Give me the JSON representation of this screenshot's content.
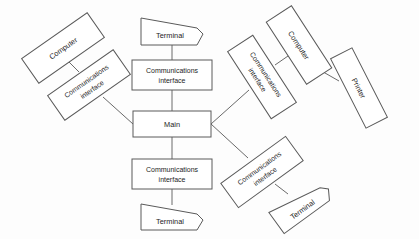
{
  "diagram": {
    "type": "node-link-diagram",
    "background_color": "#fdfdfd",
    "stroke_color": "#5a5a5a",
    "text_color": "#1d1d1d",
    "labels": {
      "main": "Main",
      "comm_line1": "Communications",
      "comm_line2": "interface",
      "terminal": "Terminal",
      "computer": "Computer",
      "printer": "Printer"
    },
    "nodes": [
      {
        "id": "main",
        "label": "Main",
        "shape": "rectangle",
        "rotation": 0,
        "x": 172,
        "y": 124
      },
      {
        "id": "comm-top",
        "label": "Communications interface",
        "shape": "rectangle",
        "rotation": 0,
        "x": 172,
        "y": 75
      },
      {
        "id": "terminal-top",
        "label": "Terminal",
        "shape": "terminal",
        "rotation": 0,
        "x": 172,
        "y": 31
      },
      {
        "id": "comm-bottom",
        "label": "Communications interface",
        "shape": "rectangle",
        "rotation": 0,
        "x": 172,
        "y": 174
      },
      {
        "id": "terminal-bottom",
        "label": "Terminal",
        "shape": "terminal",
        "rotation": 0,
        "x": 172,
        "y": 216
      },
      {
        "id": "comm-left",
        "label": "Communications interface",
        "shape": "rectangle",
        "rotation": -35,
        "x": 89,
        "y": 85
      },
      {
        "id": "computer-left",
        "label": "Computer",
        "shape": "rectangle",
        "rotation": -35,
        "x": 63,
        "y": 48
      },
      {
        "id": "comm-upper-right",
        "label": "Communications interface",
        "shape": "rectangle",
        "rotation": 57,
        "x": 262,
        "y": 77
      },
      {
        "id": "computer-right",
        "label": "Computer",
        "shape": "rectangle",
        "rotation": 57,
        "x": 299,
        "y": 45
      },
      {
        "id": "printer-right",
        "label": "Printer",
        "shape": "rectangle",
        "rotation": 63,
        "x": 359,
        "y": 88
      },
      {
        "id": "comm-lower-right",
        "label": "Communications interface",
        "shape": "rectangle",
        "rotation": -36,
        "x": 262,
        "y": 172
      },
      {
        "id": "terminal-lower-right",
        "label": "Terminal",
        "shape": "terminal",
        "rotation": -36,
        "x": 301,
        "y": 204
      }
    ],
    "edges": [
      {
        "from": "terminal-top",
        "to": "comm-top"
      },
      {
        "from": "comm-top",
        "to": "main"
      },
      {
        "from": "main",
        "to": "comm-bottom"
      },
      {
        "from": "comm-bottom",
        "to": "terminal-bottom"
      },
      {
        "from": "main",
        "to": "comm-left"
      },
      {
        "from": "comm-left",
        "to": "computer-left"
      },
      {
        "from": "main",
        "to": "comm-upper-right"
      },
      {
        "from": "comm-upper-right",
        "to": "computer-right"
      },
      {
        "from": "computer-right",
        "to": "printer-right"
      },
      {
        "from": "main",
        "to": "comm-lower-right"
      },
      {
        "from": "comm-lower-right",
        "to": "terminal-lower-right"
      }
    ]
  }
}
